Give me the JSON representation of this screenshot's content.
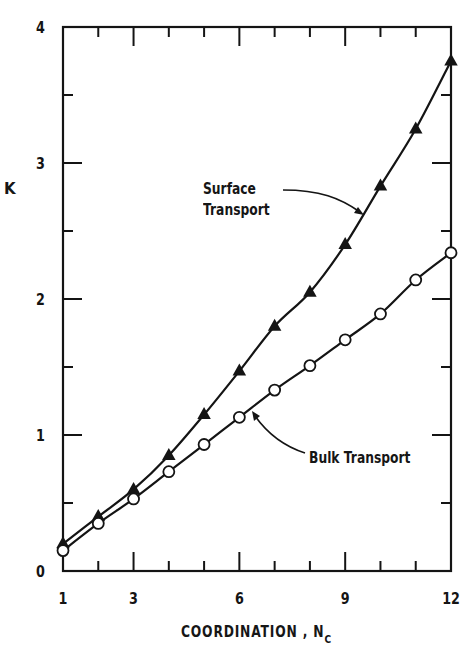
{
  "chart_data": {
    "type": "line",
    "title": "",
    "xlabel": "COORDINATION , N",
    "xlabel_subscript": "C",
    "ylabel": "K",
    "xlim": [
      1,
      12
    ],
    "ylim": [
      0,
      4
    ],
    "x_ticks": [
      1,
      3,
      6,
      9,
      12
    ],
    "x_minor_ticks": [
      2,
      4,
      5,
      7,
      8,
      10,
      11
    ],
    "y_ticks": [
      0,
      1,
      2,
      3,
      4
    ],
    "y_minor_ticks": [
      0.5,
      1.5,
      2.5,
      3.5
    ],
    "grid": false,
    "legend": "none (curves labeled with annotation arrows)",
    "x": [
      1,
      2,
      3,
      4,
      5,
      6,
      7,
      8,
      9,
      10,
      11,
      12
    ],
    "series": [
      {
        "name": "Surface Transport",
        "marker": "filled-triangle",
        "values": [
          0.2,
          0.4,
          0.6,
          0.85,
          1.15,
          1.47,
          1.8,
          2.05,
          2.4,
          2.83,
          3.25,
          3.75
        ]
      },
      {
        "name": "Bulk Transport",
        "marker": "open-circle",
        "values": [
          0.15,
          0.35,
          0.53,
          0.73,
          0.93,
          1.13,
          1.33,
          1.51,
          1.7,
          1.89,
          2.14,
          2.34
        ]
      }
    ],
    "annotations": [
      {
        "text_lines": [
          "Surface",
          "Transport"
        ],
        "points_to_series": "Surface Transport"
      },
      {
        "text_lines": [
          "Bulk  Transport"
        ],
        "points_to_series": "Bulk Transport"
      }
    ]
  },
  "labels": {
    "y_axis": "K",
    "x_axis": "COORDINATION , N",
    "x_axis_sub": "C",
    "surface_line1": "Surface",
    "surface_line2": "Transport",
    "bulk": "Bulk  Transport"
  },
  "style": {
    "ink": "#141414",
    "background": "#ffffff"
  }
}
